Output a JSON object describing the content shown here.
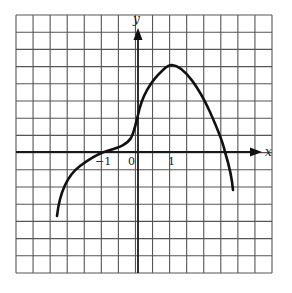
{
  "chart_data": {
    "type": "line",
    "title": "",
    "xlabel": "x",
    "ylabel": "y",
    "tick_labels": {
      "x": [
        "-1",
        "0",
        "1"
      ]
    },
    "grid": true,
    "grid_cells_per_unit": 2,
    "xlim": [
      -3.5,
      4.0
    ],
    "ylim": [
      -3.5,
      4.0
    ],
    "series": [
      {
        "name": "f(x)",
        "x": [
          -2.4,
          -2.2,
          -2.0,
          -1.5,
          -1.0,
          -0.5,
          -0.2,
          0.0,
          0.2,
          0.5,
          1.0,
          1.5,
          2.0,
          2.3,
          2.56,
          2.8
        ],
        "y": [
          -1.9,
          -1.2,
          -0.75,
          -0.25,
          0.0,
          0.15,
          0.45,
          1.1,
          1.7,
          2.2,
          2.55,
          2.2,
          1.4,
          0.75,
          0.0,
          -1.1
        ]
      }
    ],
    "annotations": [
      {
        "text": "0",
        "x": -0.2,
        "y": -0.3
      },
      {
        "text": "-1",
        "x": -1.0,
        "y": -0.3
      },
      {
        "text": "1",
        "x": 1.0,
        "y": -0.3
      }
    ]
  },
  "labels": {
    "x_axis": "x",
    "y_axis": "y",
    "tick_neg1": "−1",
    "tick_0": "0",
    "tick_1": "1"
  }
}
